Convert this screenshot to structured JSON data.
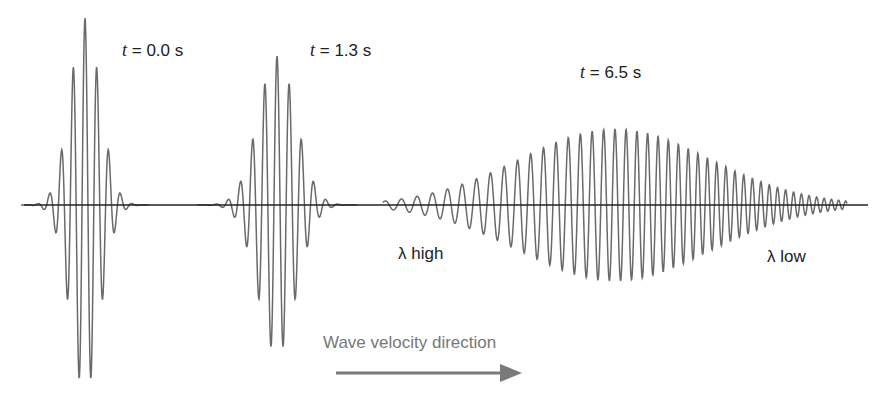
{
  "figure": {
    "title": "",
    "background": "#ffffff",
    "wave_color": "#6a6a6a",
    "axis_color": "#222222",
    "arrow_color": "#7a7a7a",
    "axis": {
      "y": 205,
      "x_start": 24,
      "x_end": 868
    }
  },
  "packets": [
    {
      "time_var": "t",
      "time_text": "= 0.0 s",
      "label_pos": [
        122,
        60
      ],
      "center": 85,
      "half_width": 64,
      "amplitude": 187,
      "wavelength": 11.8,
      "chirp": 0,
      "sigma": 15
    },
    {
      "time_var": "t",
      "time_text": "= 1.3 s",
      "label_pos": [
        310,
        60
      ],
      "center": 277,
      "half_width": 80,
      "amplitude": 149,
      "wavelength": 12.2,
      "chirp": 0,
      "sigma": 19
    },
    {
      "time_var": "t",
      "time_text": "= 6.5 s",
      "label_pos": [
        580,
        82
      ],
      "center": 615,
      "half_width": 232,
      "amplitude": 76,
      "wavelength": 11.2,
      "chirp": -0.018,
      "sigma": 95
    }
  ],
  "annotations": {
    "lambda_high": "λ high",
    "lambda_high_pos": [
      398,
      244
    ],
    "lambda_low": "λ low",
    "lambda_low_pos": [
      767,
      247
    ]
  },
  "velocity_arrow": {
    "label": "Wave velocity direction",
    "label_pos": [
      323,
      333
    ],
    "x1": 336,
    "x2": 522,
    "y": 373
  }
}
